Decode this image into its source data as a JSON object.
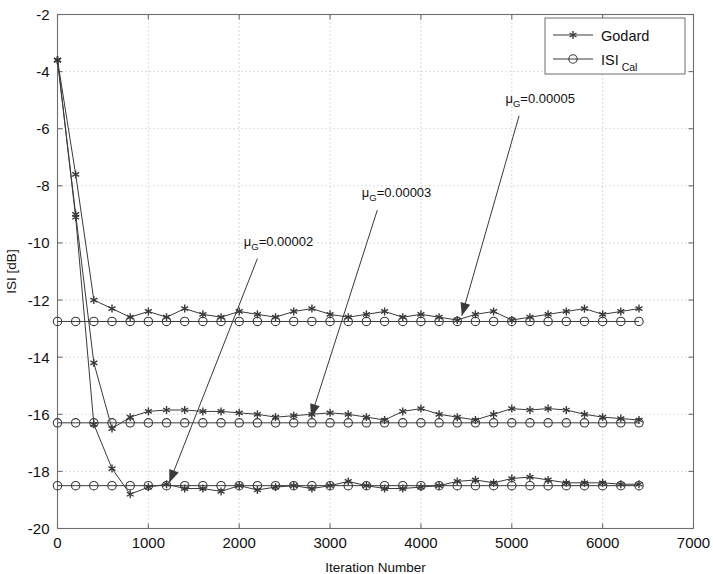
{
  "chart_data": {
    "type": "line",
    "title": "",
    "xlabel": "Iteration Number",
    "ylabel": "ISI [dB]",
    "xlim": [
      0,
      7000
    ],
    "ylim": [
      -20,
      -2
    ],
    "xticks": [
      0,
      1000,
      2000,
      3000,
      4000,
      5000,
      6000,
      7000
    ],
    "yticks": [
      -20,
      -18,
      -16,
      -14,
      -12,
      -10,
      -8,
      -6,
      -4,
      -2
    ],
    "xtick_labels": [
      "0",
      "1000",
      "2000",
      "3000",
      "4000",
      "5000",
      "6000",
      "7000"
    ],
    "ytick_labels": [
      "-20",
      "-18",
      "-16",
      "-14",
      "-12",
      "-10",
      "-8",
      "-6",
      "-4",
      "-2"
    ],
    "grid": true,
    "grid_style": "dotted",
    "legend_position": "top-right",
    "legend": [
      {
        "label": "Godard",
        "marker": "asterisk",
        "line": "solid"
      },
      {
        "label": "ISI",
        "label_sub": "Cal",
        "marker": "circle",
        "line": "solid"
      }
    ],
    "marker_step": 200,
    "series": [
      {
        "name": "Godard mu_G=0.00005",
        "marker": "asterisk",
        "group": "top",
        "x": [
          0,
          200,
          400,
          600,
          800,
          1000,
          1200,
          1400,
          1600,
          1800,
          2000,
          2200,
          2400,
          2600,
          2800,
          3000,
          3200,
          3400,
          3600,
          3800,
          4000,
          4200,
          4400,
          4600,
          4800,
          5000,
          5200,
          5400,
          5600,
          5800,
          6000,
          6200,
          6400
        ],
        "y": [
          -3.6,
          -7.6,
          -12.0,
          -12.3,
          -12.6,
          -12.4,
          -12.6,
          -12.3,
          -12.5,
          -12.6,
          -12.4,
          -12.5,
          -12.6,
          -12.4,
          -12.3,
          -12.5,
          -12.6,
          -12.5,
          -12.4,
          -12.6,
          -12.5,
          -12.6,
          -12.7,
          -12.5,
          -12.4,
          -12.7,
          -12.6,
          -12.5,
          -12.4,
          -12.3,
          -12.5,
          -12.4,
          -12.3
        ]
      },
      {
        "name": "ISI Cal mu_G=0.00005",
        "marker": "circle",
        "group": "top",
        "x": [
          0,
          200,
          400,
          600,
          800,
          1000,
          1200,
          1400,
          1600,
          1800,
          2000,
          2200,
          2400,
          2600,
          2800,
          3000,
          3200,
          3400,
          3600,
          3800,
          4000,
          4200,
          4400,
          4600,
          4800,
          5000,
          5200,
          5400,
          5600,
          5800,
          6000,
          6200,
          6400
        ],
        "y": [
          -12.75,
          -12.75,
          -12.75,
          -12.75,
          -12.75,
          -12.75,
          -12.75,
          -12.75,
          -12.75,
          -12.75,
          -12.75,
          -12.75,
          -12.75,
          -12.75,
          -12.75,
          -12.75,
          -12.75,
          -12.75,
          -12.75,
          -12.75,
          -12.75,
          -12.75,
          -12.75,
          -12.75,
          -12.75,
          -12.75,
          -12.75,
          -12.75,
          -12.75,
          -12.75,
          -12.75,
          -12.75,
          -12.75
        ]
      },
      {
        "name": "Godard mu_G=0.00003",
        "marker": "asterisk",
        "group": "middle",
        "x": [
          0,
          200,
          400,
          600,
          800,
          1000,
          1200,
          1400,
          1600,
          1800,
          2000,
          2200,
          2400,
          2600,
          2800,
          3000,
          3200,
          3400,
          3600,
          3800,
          4000,
          4200,
          4400,
          4600,
          4800,
          5000,
          5200,
          5400,
          5600,
          5800,
          6000,
          6200,
          6400
        ],
        "y": [
          -3.6,
          -9.0,
          -14.2,
          -16.5,
          -16.1,
          -15.9,
          -15.85,
          -15.85,
          -15.9,
          -15.9,
          -15.95,
          -16.0,
          -16.1,
          -16.05,
          -16.0,
          -15.95,
          -16.0,
          -16.1,
          -16.2,
          -15.9,
          -15.8,
          -16.0,
          -16.1,
          -16.2,
          -16.0,
          -15.8,
          -15.85,
          -15.8,
          -15.85,
          -16.0,
          -16.1,
          -16.15,
          -16.2
        ]
      },
      {
        "name": "ISI Cal mu_G=0.00003",
        "marker": "circle",
        "group": "middle",
        "x": [
          0,
          200,
          400,
          600,
          800,
          1000,
          1200,
          1400,
          1600,
          1800,
          2000,
          2200,
          2400,
          2600,
          2800,
          3000,
          3200,
          3400,
          3600,
          3800,
          4000,
          4200,
          4400,
          4600,
          4800,
          5000,
          5200,
          5400,
          5600,
          5800,
          6000,
          6200,
          6400
        ],
        "y": [
          -16.3,
          -16.3,
          -16.3,
          -16.3,
          -16.3,
          -16.3,
          -16.3,
          -16.3,
          -16.3,
          -16.3,
          -16.3,
          -16.3,
          -16.3,
          -16.3,
          -16.3,
          -16.3,
          -16.3,
          -16.3,
          -16.3,
          -16.3,
          -16.3,
          -16.3,
          -16.3,
          -16.3,
          -16.3,
          -16.3,
          -16.3,
          -16.3,
          -16.3,
          -16.3,
          -16.3,
          -16.3,
          -16.3
        ]
      },
      {
        "name": "Godard mu_G=0.00002",
        "marker": "asterisk",
        "group": "bottom",
        "x": [
          0,
          200,
          400,
          600,
          800,
          1000,
          1200,
          1400,
          1600,
          1800,
          2000,
          2200,
          2400,
          2600,
          2800,
          3000,
          3200,
          3400,
          3600,
          3800,
          4000,
          4200,
          4400,
          4600,
          4800,
          5000,
          5200,
          5400,
          5600,
          5800,
          6000,
          6200,
          6400
        ],
        "y": [
          -3.6,
          -9.1,
          -16.35,
          -17.9,
          -18.8,
          -18.55,
          -18.45,
          -18.6,
          -18.6,
          -18.7,
          -18.5,
          -18.65,
          -18.55,
          -18.5,
          -18.6,
          -18.5,
          -18.35,
          -18.5,
          -18.6,
          -18.6,
          -18.55,
          -18.5,
          -18.35,
          -18.3,
          -18.4,
          -18.25,
          -18.2,
          -18.3,
          -18.4,
          -18.4,
          -18.4,
          -18.45,
          -18.45
        ]
      },
      {
        "name": "ISI Cal mu_G=0.00002",
        "marker": "circle",
        "group": "bottom",
        "x": [
          0,
          200,
          400,
          600,
          800,
          1000,
          1200,
          1400,
          1600,
          1800,
          2000,
          2200,
          2400,
          2600,
          2800,
          3000,
          3200,
          3400,
          3600,
          3800,
          4000,
          4200,
          4400,
          4600,
          4800,
          5000,
          5200,
          5400,
          5600,
          5800,
          6000,
          6200,
          6400
        ],
        "y": [
          -18.5,
          -18.5,
          -18.5,
          -18.5,
          -18.5,
          -18.5,
          -18.5,
          -18.5,
          -18.5,
          -18.5,
          -18.5,
          -18.5,
          -18.5,
          -18.5,
          -18.5,
          -18.5,
          -18.5,
          -18.5,
          -18.5,
          -18.5,
          -18.5,
          -18.5,
          -18.5,
          -18.5,
          -18.5,
          -18.5,
          -18.5,
          -18.5,
          -18.5,
          -18.5,
          -18.5,
          -18.5,
          -18.5
        ]
      }
    ],
    "annotations": [
      {
        "id": "annot-mu-00002",
        "text_main": "μ",
        "text_sub": "G",
        "text_rest": "=0.00002",
        "full_text": "μ_G=0.00002",
        "label_x": 2050,
        "label_y": -10.1,
        "arrow_from_x": 2200,
        "arrow_from_y": -10.55,
        "arrow_to_x": 1230,
        "arrow_to_y": -18.4
      },
      {
        "id": "annot-mu-00003",
        "text_main": "μ",
        "text_sub": "G",
        "text_rest": "=0.00003",
        "full_text": "μ_G=0.00003",
        "label_x": 3350,
        "label_y": -8.4,
        "arrow_from_x": 3520,
        "arrow_from_y": -8.85,
        "arrow_to_x": 2790,
        "arrow_to_y": -16.1
      },
      {
        "id": "annot-mu-00005",
        "text_main": "μ",
        "text_sub": "G",
        "text_rest": "=0.00005",
        "full_text": "μ_G=0.00005",
        "label_x": 4930,
        "label_y": -5.1,
        "arrow_from_x": 5080,
        "arrow_from_y": -5.55,
        "arrow_to_x": 4450,
        "arrow_to_y": -12.55
      }
    ],
    "colors": {
      "line": "#3a3a3a",
      "axis": "#6e6e6e",
      "grid": "#b0b0b0",
      "background": "#ffffff",
      "text": "#111111"
    }
  }
}
